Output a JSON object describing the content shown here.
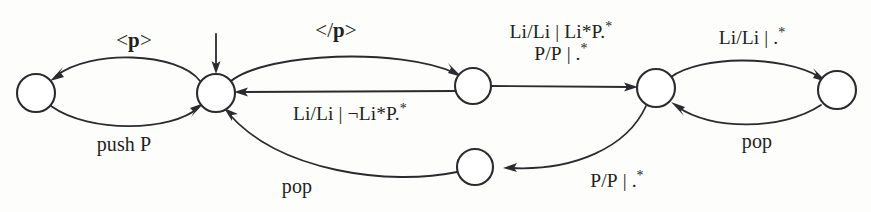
{
  "figure": {
    "kind": "state-transition-diagram",
    "background_color": "#fdfdfc",
    "stroke_color": "#2b2b2f",
    "text_color": "#231f20",
    "width": 871,
    "height": 212
  },
  "nodes": [
    {
      "id": "q0",
      "name": "state-left",
      "cx": 36,
      "cy": 93,
      "r": 19
    },
    {
      "id": "q1",
      "name": "state-start",
      "cx": 216,
      "cy": 93,
      "r": 19,
      "is_start": true
    },
    {
      "id": "q2",
      "name": "state-middle",
      "cx": 473,
      "cy": 86,
      "r": 18
    },
    {
      "id": "q3",
      "name": "state-right-hub",
      "cx": 656,
      "cy": 88,
      "r": 19
    },
    {
      "id": "q4",
      "name": "state-far-right",
      "cx": 837,
      "cy": 90,
      "r": 19
    },
    {
      "id": "q5",
      "name": "state-bottom",
      "cx": 475,
      "cy": 167,
      "r": 18
    }
  ],
  "start_marker": {
    "name": "start-arrow",
    "x": 216,
    "y_top": 34,
    "y_bottom": 71
  },
  "edges": [
    {
      "id": "e1",
      "name": "edge-open-p",
      "from": "q1",
      "to": "q0",
      "label": "<p>",
      "label_html": "&lt;<b>p</b>&gt;",
      "label_x": 134,
      "label_y": 41,
      "label_class": "lbl-tag"
    },
    {
      "id": "e2",
      "name": "edge-push-p",
      "from": "q0",
      "to": "q1",
      "label": "push P",
      "label_html": "push P",
      "label_x": 124,
      "label_y": 144,
      "label_class": "lbl-stack"
    },
    {
      "id": "e3",
      "name": "edge-close-p",
      "from": "q1",
      "to": "q2",
      "label": "</p>",
      "label_html": "&lt;/<b>p</b>&gt;",
      "label_x": 336,
      "label_y": 31,
      "label_class": "lbl-tag"
    },
    {
      "id": "e4",
      "name": "edge-not-li-star-p",
      "from": "q2",
      "to": "q1",
      "label": "Li/Li | ¬Li*P.*",
      "label_html": "Li/Li&nbsp;|&nbsp;¬Li*P.<span class=\"sup\">*</span>",
      "label_x": 350,
      "label_y": 114,
      "label_class": "lbl-cond"
    },
    {
      "id": "e5",
      "name": "edge-li-star-p",
      "from": "q2",
      "to": "q3",
      "label": "Li/Li | Li*P.*\nP/P | .*",
      "label_line1_html": "Li/Li&nbsp;|&nbsp;Li*P.<span class=\"sup\">*</span>",
      "label_line2_html": "P/P&nbsp;|&nbsp;.<span class=\"sup\">*</span>",
      "label_x": 561,
      "label_y": 43,
      "label_class": "lbl-two"
    },
    {
      "id": "e6",
      "name": "edge-li-any",
      "from": "q3",
      "to": "q4",
      "label": "Li/Li | .*",
      "label_html": "Li/Li&nbsp;|&nbsp;.<span class=\"sup\">*</span>",
      "label_x": 752,
      "label_y": 38,
      "label_class": "lbl-cond"
    },
    {
      "id": "e7",
      "name": "edge-pop-right",
      "from": "q4",
      "to": "q3",
      "label": "pop",
      "label_html": "pop",
      "label_x": 757,
      "label_y": 141,
      "label_class": "lbl-stack"
    },
    {
      "id": "e8",
      "name": "edge-p-any",
      "from": "q3",
      "to": "q5",
      "label": "P/P | .*",
      "label_html": "P/P&nbsp;|&nbsp;.<span class=\"sup\">*</span>",
      "label_x": 617,
      "label_y": 181,
      "label_class": "lbl-cond"
    },
    {
      "id": "e9",
      "name": "edge-pop-bottom",
      "from": "q5",
      "to": "q1",
      "label": "pop",
      "label_html": "pop",
      "label_x": 297,
      "label_y": 186,
      "label_class": "lbl-stack"
    }
  ]
}
